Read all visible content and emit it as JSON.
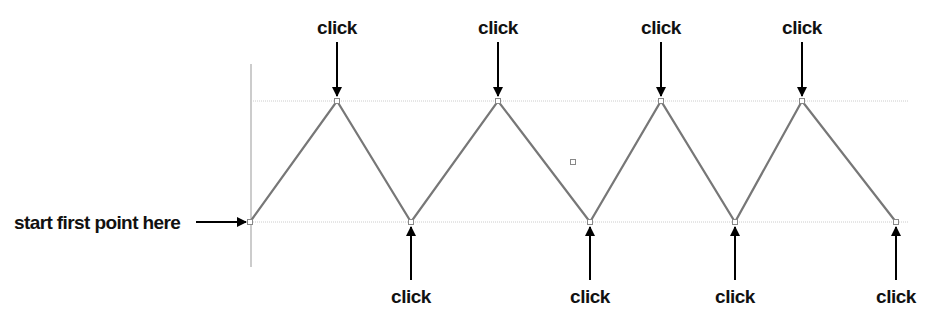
{
  "diagram": {
    "start_label": "start first point here",
    "click_label": "click",
    "colors": {
      "zigzag": "#777777",
      "guide": "#cccccc",
      "arrow": "#000000",
      "axis": "#999999"
    },
    "top_clicks": [
      {
        "label": "click",
        "x": 337
      },
      {
        "label": "click",
        "x": 498
      },
      {
        "label": "click",
        "x": 661
      },
      {
        "label": "click",
        "x": 802
      }
    ],
    "bottom_clicks": [
      {
        "label": "click",
        "x": 411
      },
      {
        "label": "click",
        "x": 590
      },
      {
        "label": "click",
        "x": 735
      },
      {
        "label": "click",
        "x": 896
      }
    ],
    "points": [
      [
        250,
        222
      ],
      [
        337,
        101
      ],
      [
        411,
        222
      ],
      [
        498,
        101
      ],
      [
        590,
        222
      ],
      [
        661,
        101
      ],
      [
        735,
        222
      ],
      [
        802,
        101
      ],
      [
        896,
        222
      ]
    ],
    "stray_point": [
      573,
      162
    ]
  }
}
